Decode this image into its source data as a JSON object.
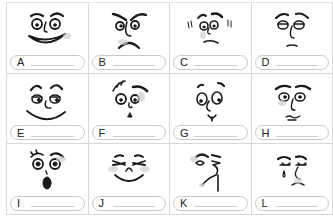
{
  "worksheet": {
    "cells": [
      {
        "letter": "A",
        "expression": "grinning-face"
      },
      {
        "letter": "B",
        "expression": "angry-frowning-face"
      },
      {
        "letter": "C",
        "expression": "nervous-trembling-face"
      },
      {
        "letter": "D",
        "expression": "bored-sleepy-face"
      },
      {
        "letter": "E",
        "expression": "content-smiling-face"
      },
      {
        "letter": "F",
        "expression": "shocked-confused-face"
      },
      {
        "letter": "G",
        "expression": "surprised-face"
      },
      {
        "letter": "H",
        "expression": "worried-face"
      },
      {
        "letter": "I",
        "expression": "astonished-face"
      },
      {
        "letter": "J",
        "expression": "laughing-face"
      },
      {
        "letter": "K",
        "expression": "disgusted-face"
      },
      {
        "letter": "L",
        "expression": "crying-sad-face"
      }
    ]
  }
}
